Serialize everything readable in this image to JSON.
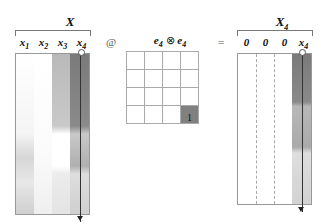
{
  "left_matrix": {
    "title": "X",
    "columns": [
      {
        "label": "x",
        "sub": "1"
      },
      {
        "label": "x",
        "sub": "2"
      },
      {
        "label": "x",
        "sub": "3"
      },
      {
        "label": "x",
        "sub": "4"
      }
    ]
  },
  "operator_at": "@",
  "middle_matrix": {
    "title": "e",
    "title_sub": "4",
    "title_op": "⊗",
    "title2": "e",
    "title2_sub": "4",
    "one_value": "1",
    "highlight_color": "#808080"
  },
  "operator_equals": "=",
  "right_matrix": {
    "title": "X",
    "title_sub": "4",
    "columns": [
      {
        "label": "0",
        "sub": ""
      },
      {
        "label": "0",
        "sub": ""
      },
      {
        "label": "0",
        "sub": ""
      },
      {
        "label": "x",
        "sub": "4"
      }
    ]
  },
  "colors": {
    "dark_column": "#7a7a7a",
    "mid_column": "#b5b5b5",
    "light_column": "#dcdcdc"
  }
}
